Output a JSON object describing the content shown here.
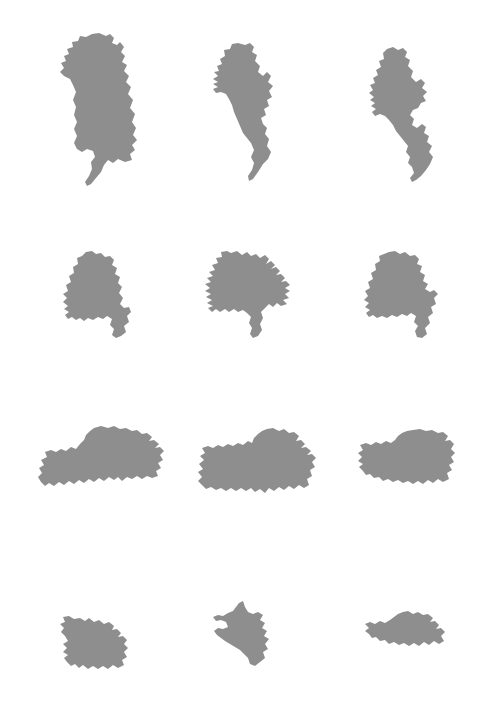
{
  "figure": {
    "background_color": "#ffffff",
    "shape_fill_color": "#8e8e8e",
    "width": 487,
    "height": 711,
    "columns": 3,
    "rows": 4,
    "total_shapes": 12
  },
  "chart_data": {
    "type": "table",
    "xlabel": "",
    "ylabel": "",
    "grid": false,
    "legend": "none",
    "columns": [
      "column-1",
      "column-2",
      "column-3"
    ],
    "rows": [
      "row-1",
      "row-2",
      "row-3",
      "row-4"
    ],
    "cells": [
      {
        "id": "shape-r1c1",
        "row": 1,
        "col": 1,
        "x": 58,
        "y": 32,
        "width": 88,
        "height": 155,
        "orientation": "vertical-elongated",
        "note": "Tall blob with a narrow tapering tail at lower-left"
      },
      {
        "id": "shape-r1c2",
        "row": 1,
        "col": 2,
        "x": 207,
        "y": 42,
        "width": 82,
        "height": 140,
        "orientation": "vertical-elongated",
        "note": "Body with a slender hooked tail trailing to the lower-right"
      },
      {
        "id": "shape-r1c3",
        "row": 1,
        "col": 3,
        "x": 360,
        "y": 46,
        "width": 86,
        "height": 137,
        "orientation": "vertical-elongated",
        "note": "Upper mass joined by a thin isthmus to a lower lobe"
      },
      {
        "id": "shape-r2c1",
        "row": 2,
        "col": 1,
        "x": 60,
        "y": 250,
        "width": 72,
        "height": 90,
        "orientation": "compact",
        "note": "Rounded blob with a small foot at lower-right"
      },
      {
        "id": "shape-r2c2",
        "row": 2,
        "col": 2,
        "x": 203,
        "y": 250,
        "width": 95,
        "height": 90,
        "orientation": "compact",
        "note": "Spiky blob with several short protrusions on the left and right"
      },
      {
        "id": "shape-r2c3",
        "row": 2,
        "col": 3,
        "x": 362,
        "y": 250,
        "width": 80,
        "height": 90,
        "orientation": "compact",
        "note": "Rounded blob with a tapering foot at lower-right"
      },
      {
        "id": "shape-r3c1",
        "row": 3,
        "col": 1,
        "x": 36,
        "y": 425,
        "width": 130,
        "height": 68,
        "orientation": "horizontal-wide",
        "note": "Wide landmass, tallest toward its right side"
      },
      {
        "id": "shape-r3c2",
        "row": 3,
        "col": 2,
        "x": 195,
        "y": 427,
        "width": 123,
        "height": 72,
        "orientation": "horizontal-wide",
        "note": "Wide landmass with a raised right hump and ragged bottom"
      },
      {
        "id": "shape-r3c3",
        "row": 3,
        "col": 3,
        "x": 355,
        "y": 428,
        "width": 103,
        "height": 63,
        "orientation": "horizontal-wide",
        "note": "Wide blob with a notched upper-left and bulky right side"
      },
      {
        "id": "shape-r4c1",
        "row": 4,
        "col": 1,
        "x": 58,
        "y": 615,
        "width": 78,
        "height": 56,
        "orientation": "small-horizontal",
        "note": "Small blob with a pointed spur at the upper-left"
      },
      {
        "id": "shape-r4c2",
        "row": 4,
        "col": 2,
        "x": 212,
        "y": 600,
        "width": 60,
        "height": 68,
        "orientation": "small-angular",
        "note": "Angular shape with a horn at top and a wing at the left"
      },
      {
        "id": "shape-r4c3",
        "row": 4,
        "col": 3,
        "x": 363,
        "y": 610,
        "width": 88,
        "height": 45,
        "orientation": "small-horizontal",
        "note": "Flat elongated blob tilted slightly upward to the right"
      }
    ]
  }
}
